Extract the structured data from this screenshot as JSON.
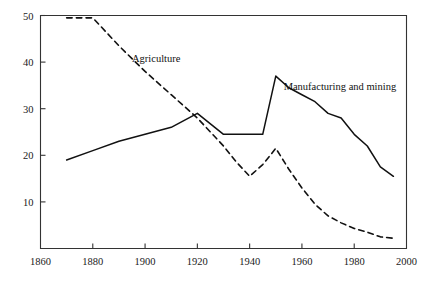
{
  "chart_data": {
    "type": "line",
    "title": "",
    "subtitle": "",
    "xlabel": "",
    "ylabel": "",
    "xlim": [
      1860,
      2000
    ],
    "ylim": [
      0,
      50
    ],
    "xticks": [
      1860,
      1880,
      1900,
      1920,
      1940,
      1960,
      1980,
      2000
    ],
    "yticks": [
      10,
      20,
      30,
      40,
      50
    ],
    "xticklabels": [
      "1860",
      "1880",
      "1900",
      "1920",
      "1940",
      "1960",
      "1980",
      "2000"
    ],
    "yticklabels": [
      "10",
      "20",
      "30",
      "40",
      "50"
    ],
    "grid": false,
    "legend_position": "inline-annotation",
    "series": [
      {
        "name": "Agriculture",
        "style": "dashed",
        "color": "#111111",
        "label_x": 1895,
        "label_y": 40.0,
        "x": [
          1870,
          1880,
          1890,
          1900,
          1910,
          1920,
          1930,
          1935,
          1940,
          1945,
          1950,
          1955,
          1960,
          1965,
          1970,
          1975,
          1980,
          1985,
          1990,
          1995
        ],
        "values": [
          49.5,
          49.5,
          43.5,
          38.0,
          33.0,
          28.0,
          22.0,
          18.5,
          15.5,
          18.0,
          21.5,
          17.0,
          13.0,
          9.5,
          7.0,
          5.5,
          4.3,
          3.5,
          2.5,
          2.2
        ]
      },
      {
        "name": "Manufacturing and mining",
        "style": "solid",
        "color": "#111111",
        "label_x": 1953,
        "label_y": 34.0,
        "x": [
          1870,
          1880,
          1890,
          1900,
          1910,
          1920,
          1930,
          1940,
          1945,
          1950,
          1955,
          1960,
          1965,
          1970,
          1975,
          1980,
          1985,
          1990,
          1995
        ],
        "values": [
          19.0,
          21.0,
          23.0,
          24.5,
          26.0,
          29.0,
          24.5,
          24.5,
          24.5,
          37.0,
          34.5,
          33.0,
          31.5,
          29.0,
          28.0,
          24.5,
          22.0,
          17.5,
          15.5
        ]
      }
    ]
  },
  "annotations": {
    "agriculture_label": "Agriculture",
    "manufacturing_label": "Manufacturing and mining"
  }
}
